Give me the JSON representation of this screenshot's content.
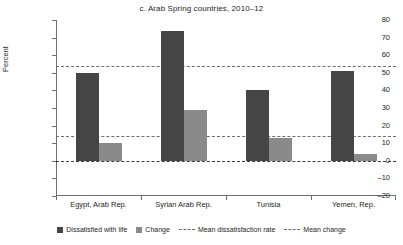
{
  "chart_data": {
    "type": "bar",
    "title": "c. Arab Spring countries, 2010–12",
    "xlabel": "",
    "ylabel": "Percent",
    "ylim": [
      -20,
      80
    ],
    "ytick_step": 10,
    "yticks": [
      "80",
      "70",
      "60",
      "50",
      "40",
      "30",
      "20",
      "10",
      "0",
      "–10",
      "–20"
    ],
    "grid": false,
    "legend_position": "bottom",
    "categories": [
      "Egypt, Arab Rep.",
      "Syrian Arab Rep.",
      "Tunisia",
      "Yemen, Rep."
    ],
    "series": [
      {
        "name": "Dissatisfied with life",
        "color": "#454545",
        "values": [
          50,
          74,
          40,
          51
        ]
      },
      {
        "name": "Change",
        "color": "#8a8a8a",
        "values": [
          10,
          29,
          13,
          4
        ]
      }
    ],
    "reference_lines": [
      {
        "name": "Mean dissatisfaction rate",
        "value": 54,
        "style": "dashed",
        "color": "#6d6e71"
      },
      {
        "name": "Mean change",
        "value": 14,
        "style": "dashed",
        "color": "#6d6e71"
      }
    ],
    "zero_line": {
      "value": 0,
      "style": "dashed",
      "color": "#3b3b3b"
    }
  },
  "legend": {
    "items": [
      {
        "label": "Dissatisfied with life",
        "marker": "square-dark"
      },
      {
        "label": "Change",
        "marker": "square-light"
      },
      {
        "label": "Mean dissatisfaction rate",
        "marker": "dashed-line"
      },
      {
        "label": "Mean change",
        "marker": "dashed-line"
      }
    ]
  }
}
